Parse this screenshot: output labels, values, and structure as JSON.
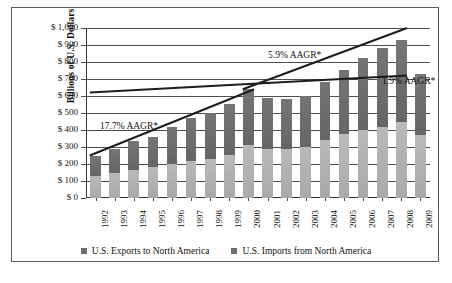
{
  "chart_data": {
    "type": "bar",
    "subtype": "stacked-bar-with-trendlines",
    "title": "",
    "xlabel": "",
    "ylabel": "Billions of U.S. Dollars",
    "ylim": [
      0,
      1000
    ],
    "ytick_values": [
      0,
      100,
      200,
      300,
      400,
      500,
      600,
      700,
      800,
      900,
      1000
    ],
    "ytick_labels": [
      "$ 0",
      "$ 100",
      "$ 200",
      "$ 300",
      "$ 400",
      "$ 500",
      "$ 600",
      "$ 700",
      "$ 800",
      "$ 900",
      "$ 1,000"
    ],
    "grid": true,
    "grid_axis": "y",
    "legend_position": "bottom-center",
    "categories": [
      "1992",
      "1993",
      "1994",
      "1995",
      "1996",
      "1997",
      "1998",
      "1999",
      "2000",
      "2001",
      "2002",
      "2003",
      "2004",
      "2005",
      "2006",
      "2007",
      "2008",
      "2009"
    ],
    "series": [
      {
        "name": "U.S. Imports from North America",
        "color": "#b3b3b3",
        "stack_position": "bottom",
        "values": [
          130,
          145,
          165,
          180,
          200,
          220,
          230,
          255,
          310,
          290,
          290,
          300,
          340,
          375,
          400,
          415,
          450,
          370
        ]
      },
      {
        "name": "U.S. Exports to North America",
        "color": "#6e6e6e",
        "stack_position": "top",
        "values": [
          120,
          145,
          170,
          180,
          215,
          250,
          270,
          300,
          330,
          300,
          295,
          300,
          345,
          380,
          425,
          470,
          480,
          360
        ]
      }
    ],
    "totals": [
      250,
      290,
      335,
      360,
      415,
      470,
      500,
      555,
      640,
      590,
      585,
      600,
      685,
      755,
      825,
      885,
      930,
      730
    ],
    "annotations": [
      {
        "text": "17.7% AAGR*",
        "x_start": "1992",
        "x_end": "2000",
        "y_start": 250,
        "y_end": 640
      },
      {
        "text": "5.9% AAGR*",
        "x_start": "2000",
        "x_end": "2008",
        "y_start": 640,
        "y_end": 1000
      },
      {
        "text": "1.9% AAGR*",
        "x_start": "1992",
        "x_end": "2009",
        "y_start": 620,
        "y_end": 720
      }
    ],
    "trendlines": [
      {
        "label": "17.7% AAGR*",
        "points": [
          [
            0,
            250
          ],
          [
            8,
            640
          ]
        ]
      },
      {
        "label": "5.9% AAGR*",
        "points": [
          [
            8,
            640
          ],
          [
            16,
            1000
          ]
        ]
      },
      {
        "label": "1.9% AAGR*",
        "points": [
          [
            0,
            620
          ],
          [
            16,
            720
          ]
        ]
      }
    ],
    "footnote_marker": "*"
  },
  "legend": {
    "items": [
      {
        "label": "U.S. Exports to North America",
        "swatch": "legend-swatch-exports"
      },
      {
        "label": "U.S. Imports from North America",
        "swatch": "legend-swatch-imports"
      }
    ]
  }
}
